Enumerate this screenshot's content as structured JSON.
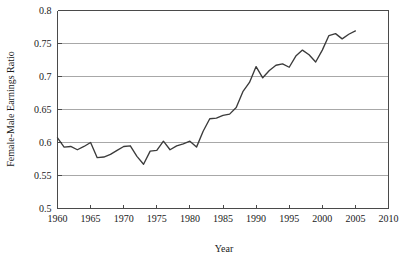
{
  "chart_data": {
    "type": "line",
    "title": "",
    "xlabel": "Year",
    "ylabel": "Female-Male Earnings Ratio",
    "xlim": [
      1960,
      2010
    ],
    "ylim": [
      0.5,
      0.8
    ],
    "grid": true,
    "legend": "none",
    "xticks": [
      "1960",
      "1965",
      "1970",
      "1975",
      "1980",
      "1985",
      "1990",
      "1995",
      "2000",
      "2005",
      "2010"
    ],
    "xtick_values": [
      1960,
      1965,
      1970,
      1975,
      1980,
      1985,
      1990,
      1995,
      2000,
      2005,
      2010
    ],
    "yticks": [
      "0.5",
      "0.55",
      "0.6",
      "0.65",
      "0.7",
      "0.75",
      "0.8"
    ],
    "ytick_values": [
      0.5,
      0.55,
      0.6,
      0.65,
      0.7,
      0.75,
      0.8
    ],
    "x": [
      1960,
      1961,
      1962,
      1963,
      1964,
      1965,
      1966,
      1967,
      1968,
      1969,
      1970,
      1971,
      1972,
      1973,
      1974,
      1975,
      1976,
      1977,
      1978,
      1979,
      1980,
      1981,
      1982,
      1983,
      1984,
      1985,
      1986,
      1987,
      1988,
      1989,
      1990,
      1991,
      1992,
      1993,
      1994,
      1995,
      1996,
      1997,
      1998,
      1999,
      2000,
      2001,
      2002,
      2003,
      2004,
      2005
    ],
    "values": [
      0.607,
      0.593,
      0.594,
      0.589,
      0.594,
      0.6,
      0.577,
      0.578,
      0.582,
      0.588,
      0.594,
      0.595,
      0.579,
      0.567,
      0.587,
      0.588,
      0.602,
      0.589,
      0.595,
      0.598,
      0.602,
      0.593,
      0.617,
      0.636,
      0.637,
      0.641,
      0.643,
      0.653,
      0.677,
      0.691,
      0.715,
      0.698,
      0.709,
      0.717,
      0.719,
      0.714,
      0.731,
      0.74,
      0.733,
      0.722,
      0.74,
      0.762,
      0.765,
      0.757,
      0.764,
      0.769
    ],
    "series_name": "Female-Male Earnings Ratio"
  },
  "axes": {
    "y_title": "Female-Male Earnings Ratio",
    "x_title": "Year"
  }
}
